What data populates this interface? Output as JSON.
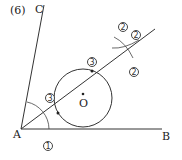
{
  "problem_number": "(6)",
  "points": {
    "A": "A",
    "B": "B",
    "C": "C",
    "O": "O"
  },
  "step_marks": {
    "one": "1",
    "two": "2",
    "three": "3"
  },
  "colors": {
    "line": "#333333",
    "background": "#ffffff"
  }
}
